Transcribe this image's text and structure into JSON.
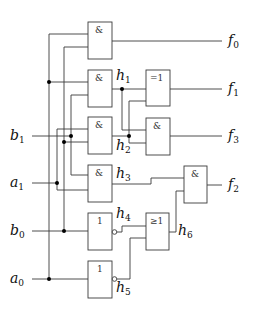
{
  "diagram": {
    "type": "logic-circuit",
    "inputs": [
      {
        "name": "b",
        "sub": "1"
      },
      {
        "name": "a",
        "sub": "1"
      },
      {
        "name": "b",
        "sub": "0"
      },
      {
        "name": "a",
        "sub": "0"
      }
    ],
    "outputs": [
      {
        "name": "f",
        "sub": "0"
      },
      {
        "name": "f",
        "sub": "1"
      },
      {
        "name": "f",
        "sub": "3"
      },
      {
        "name": "f",
        "sub": "2"
      }
    ],
    "intermediates": [
      {
        "name": "h",
        "sub": "1"
      },
      {
        "name": "h",
        "sub": "2"
      },
      {
        "name": "h",
        "sub": "3"
      },
      {
        "name": "h",
        "sub": "4"
      },
      {
        "name": "h",
        "sub": "5"
      },
      {
        "name": "h",
        "sub": "6"
      }
    ],
    "gates": [
      {
        "id": "and-f0",
        "symbol": "&"
      },
      {
        "id": "and-h1",
        "symbol": "&"
      },
      {
        "id": "xor-f1",
        "symbol": "=1"
      },
      {
        "id": "and-h2",
        "symbol": "&"
      },
      {
        "id": "and-f3",
        "symbol": "&"
      },
      {
        "id": "and-h3",
        "symbol": "&"
      },
      {
        "id": "and-f2",
        "symbol": "&"
      },
      {
        "id": "not-h4",
        "symbol": "1"
      },
      {
        "id": "or-h6",
        "symbol": "≥1"
      },
      {
        "id": "not-h5",
        "symbol": "1"
      }
    ]
  }
}
